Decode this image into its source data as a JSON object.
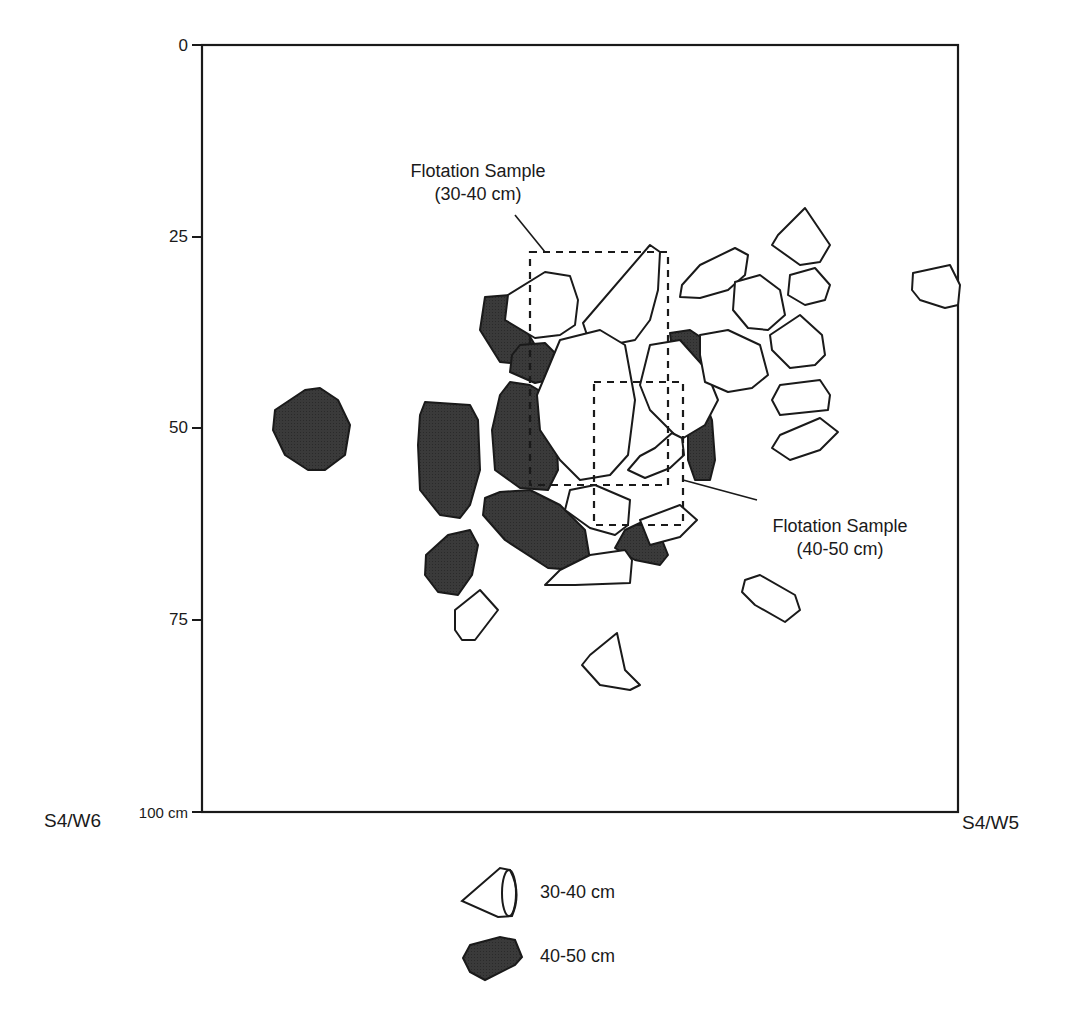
{
  "figure": {
    "type": "excavation-unit-plan",
    "y_axis": {
      "ticks": [
        {
          "label": "0",
          "value": 0
        },
        {
          "label": "25",
          "value": 25
        },
        {
          "label": "50",
          "value": 50
        },
        {
          "label": "75",
          "value": 75
        },
        {
          "label": "100 cm",
          "value": 100
        }
      ]
    },
    "corners": {
      "bottom_left": "S4/W6",
      "bottom_right": "S4/W5"
    },
    "annotations": {
      "sample_upper": {
        "line1": "Flotation Sample",
        "line2": "(30-40 cm)"
      },
      "sample_lower": {
        "line1": "Flotation Sample",
        "line2": "(40-50 cm)"
      }
    },
    "legend": [
      {
        "label": "30-40 cm",
        "symbol": "open-rock",
        "fill": "#ffffff"
      },
      {
        "label": "40-50 cm",
        "symbol": "filled-rock",
        "fill": "#333333"
      }
    ],
    "colors": {
      "line": "#1a1a1a",
      "dark_rock": "#333333",
      "light_rock": "#ffffff"
    }
  }
}
